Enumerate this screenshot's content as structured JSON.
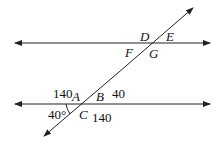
{
  "diagram": {
    "type": "parallel lines cut by transversal",
    "lines": {
      "top": {
        "y": 43,
        "x1": 15,
        "x2": 210
      },
      "bottom": {
        "y": 104,
        "x1": 15,
        "x2": 210
      },
      "transversal": {
        "x1": 45,
        "y1": 136,
        "x2": 193,
        "y2": 8
      }
    },
    "labels": {
      "D": "D",
      "E": "E",
      "F": "F",
      "G": "G",
      "A": "A",
      "B": "B",
      "C": "C",
      "a140_top": "140",
      "b40": "40",
      "c140": "140",
      "angle40": "40°"
    }
  }
}
